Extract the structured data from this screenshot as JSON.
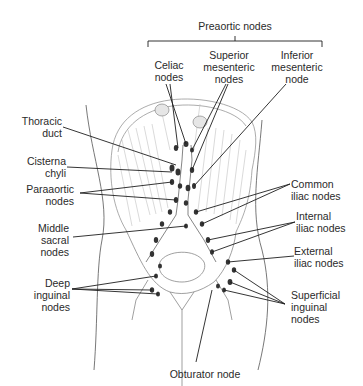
{
  "diagram": {
    "group_label": "Preaortic nodes",
    "top_labels": [
      {
        "id": "celiac",
        "lines": [
          "Celiac",
          "nodes"
        ]
      },
      {
        "id": "superior-mesenteric",
        "lines": [
          "Superior",
          "mesenteric",
          "nodes"
        ]
      },
      {
        "id": "inferior-mesenteric",
        "lines": [
          "Inferior",
          "mesenteric",
          "node"
        ]
      }
    ],
    "left_labels": [
      {
        "id": "thoracic-duct",
        "lines": [
          "Thoracic",
          "duct"
        ]
      },
      {
        "id": "cisterna-chyli",
        "lines": [
          "Cisterna",
          "chyli"
        ]
      },
      {
        "id": "paraaortic",
        "lines": [
          "Paraaortic",
          "nodes"
        ]
      },
      {
        "id": "middle-sacral",
        "lines": [
          "Middle",
          "sacral",
          "nodes"
        ]
      },
      {
        "id": "deep-inguinal",
        "lines": [
          "Deep",
          "inguinal",
          "nodes"
        ]
      }
    ],
    "right_labels": [
      {
        "id": "common-iliac",
        "lines": [
          "Common",
          "iliac nodes"
        ]
      },
      {
        "id": "internal-iliac",
        "lines": [
          "Internal",
          "iliac nodes"
        ]
      },
      {
        "id": "external-iliac",
        "lines": [
          "External",
          "iliac nodes"
        ]
      },
      {
        "id": "superficial-inguinal",
        "lines": [
          "Superficial",
          "inguinal",
          "nodes"
        ]
      }
    ],
    "bottom_labels": [
      {
        "id": "obturator",
        "lines": [
          "Obturator node"
        ]
      }
    ],
    "colors": {
      "ink": "#222222",
      "sketch": "#9a9a9a",
      "node": "#333333",
      "background": "#ffffff"
    }
  }
}
